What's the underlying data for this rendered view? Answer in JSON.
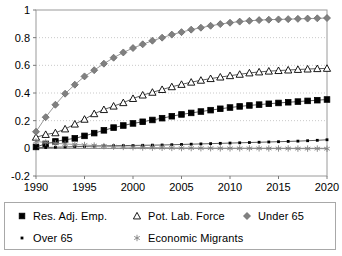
{
  "chart_data": {
    "type": "line",
    "title": "",
    "xlabel": "",
    "ylabel": "",
    "xlim": [
      1990,
      2020
    ],
    "ylim": [
      -0.2,
      1.0
    ],
    "grid": true,
    "grid_style": "dotted-horizontal",
    "legend_position": "bottom",
    "x_ticks": [
      "1990",
      "1995",
      "2000",
      "2005",
      "2010",
      "2015",
      "2020"
    ],
    "y_ticks": [
      "1",
      "0.8",
      "0.6",
      "0.4",
      "0.2",
      "0",
      "-0.2"
    ],
    "x": [
      1990,
      1991,
      1992,
      1993,
      1994,
      1995,
      1996,
      1997,
      1998,
      1999,
      2000,
      2001,
      2002,
      2003,
      2004,
      2005,
      2006,
      2007,
      2008,
      2009,
      2010,
      2011,
      2012,
      2013,
      2014,
      2015,
      2016,
      2017,
      2018,
      2019,
      2020
    ],
    "series": [
      {
        "name": "Res. Adj. Emp.",
        "marker": "filled-square",
        "color": "#000000",
        "values": [
          0.01,
          0.032,
          0.05,
          0.062,
          0.072,
          0.09,
          0.11,
          0.13,
          0.15,
          0.165,
          0.18,
          0.192,
          0.205,
          0.218,
          0.232,
          0.245,
          0.256,
          0.266,
          0.276,
          0.286,
          0.295,
          0.303,
          0.31,
          0.316,
          0.322,
          0.328,
          0.333,
          0.338,
          0.343,
          0.348,
          0.353
        ]
      },
      {
        "name": "Pot. Lab. Force",
        "marker": "hollow-triangle",
        "color": "#000000",
        "values": [
          0.08,
          0.1,
          0.112,
          0.14,
          0.175,
          0.21,
          0.25,
          0.28,
          0.305,
          0.33,
          0.36,
          0.385,
          0.405,
          0.425,
          0.445,
          0.462,
          0.478,
          0.492,
          0.504,
          0.515,
          0.525,
          0.535,
          0.545,
          0.552,
          0.558,
          0.562,
          0.566,
          0.57,
          0.573,
          0.576,
          0.578
        ]
      },
      {
        "name": "Under 65",
        "marker": "diamond",
        "color": "#808080",
        "values": [
          0.12,
          0.225,
          0.315,
          0.395,
          0.46,
          0.52,
          0.565,
          0.612,
          0.655,
          0.693,
          0.725,
          0.752,
          0.778,
          0.8,
          0.822,
          0.84,
          0.858,
          0.872,
          0.886,
          0.898,
          0.908,
          0.916,
          0.922,
          0.927,
          0.93,
          0.932,
          0.934,
          0.936,
          0.938,
          0.94,
          0.942
        ]
      },
      {
        "name": "Over 65",
        "marker": "plus",
        "color": "#000000",
        "values": [
          0.004,
          0.006,
          0.008,
          0.01,
          0.012,
          0.014,
          0.016,
          0.018,
          0.019,
          0.02,
          0.021,
          0.022,
          0.023,
          0.024,
          0.026,
          0.028,
          0.03,
          0.032,
          0.034,
          0.036,
          0.038,
          0.04,
          0.042,
          0.044,
          0.046,
          0.048,
          0.05,
          0.052,
          0.055,
          0.058,
          0.062
        ]
      },
      {
        "name": "Economic Migrants",
        "marker": "asterisk",
        "color": "#808080",
        "values": [
          0.05,
          0.042,
          0.036,
          0.032,
          0.028,
          0.024,
          0.02,
          0.016,
          0.012,
          0.01,
          0.008,
          0.006,
          0.005,
          0.004,
          0.003,
          0.002,
          0.002,
          0.001,
          0.001,
          0.0,
          0.0,
          0.0,
          0.0,
          0.0,
          -0.001,
          -0.001,
          -0.001,
          -0.002,
          -0.002,
          -0.002,
          -0.003
        ]
      }
    ]
  },
  "legend": {
    "entries": [
      {
        "label": "Res. Adj. Emp.",
        "marker": "filled-square"
      },
      {
        "label": "Pot. Lab. Force",
        "marker": "hollow-triangle"
      },
      {
        "label": "Under 65",
        "marker": "diamond"
      },
      {
        "label": "Over 65",
        "marker": "plus"
      },
      {
        "label": "Economic Migrants",
        "marker": "asterisk"
      }
    ]
  }
}
